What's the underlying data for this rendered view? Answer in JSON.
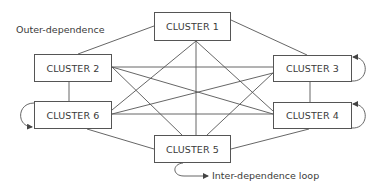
{
  "diagram": {
    "type": "network-cluster-dependence",
    "clusters": [
      {
        "id": "c1",
        "label": "CLUSTER 1"
      },
      {
        "id": "c2",
        "label": "CLUSTER 2"
      },
      {
        "id": "c3",
        "label": "CLUSTER 3"
      },
      {
        "id": "c4",
        "label": "CLUSTER 4"
      },
      {
        "id": "c5",
        "label": "CLUSTER 5"
      },
      {
        "id": "c6",
        "label": "CLUSTER 6"
      }
    ],
    "annotations": {
      "outer_dependence": "Outer-dependence",
      "inter_dependence_loop": "Inter-dependence loop"
    },
    "edges": [
      [
        "c1",
        "c2"
      ],
      [
        "c1",
        "c3"
      ],
      [
        "c1",
        "c4"
      ],
      [
        "c1",
        "c5"
      ],
      [
        "c1",
        "c6"
      ],
      [
        "c2",
        "c3"
      ],
      [
        "c2",
        "c4"
      ],
      [
        "c2",
        "c5"
      ],
      [
        "c2",
        "c6"
      ],
      [
        "c3",
        "c4"
      ],
      [
        "c3",
        "c5"
      ],
      [
        "c3",
        "c6"
      ],
      [
        "c4",
        "c5"
      ],
      [
        "c4",
        "c6"
      ],
      [
        "c5",
        "c6"
      ]
    ],
    "self_loops": [
      "c3",
      "c4",
      "c5",
      "c6"
    ],
    "colors": {
      "line": "#555555",
      "text": "#3a3a3a",
      "background": "#ffffff"
    }
  }
}
